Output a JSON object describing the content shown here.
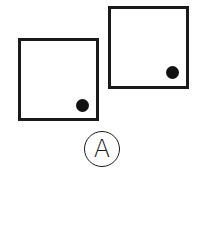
{
  "figure": {
    "squares": [
      {
        "id": "left",
        "x": 18,
        "y": 38,
        "w": 81,
        "h": 83,
        "dot": {
          "cx": 82.5,
          "cy": 105,
          "r": 6.5
        }
      },
      {
        "id": "right",
        "x": 108,
        "y": 6,
        "w": 81,
        "h": 83,
        "dot": {
          "cx": 172.5,
          "cy": 72,
          "r": 6.5
        }
      }
    ],
    "option_label": "A",
    "option_circle": {
      "cx": 102,
      "cy": 149,
      "r": 18
    }
  }
}
